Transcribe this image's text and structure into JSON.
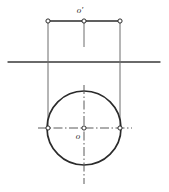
{
  "figure": {
    "type": "technical-drawing",
    "canvas": {
      "width": 169,
      "height": 192,
      "background": "#ffffff"
    },
    "colors": {
      "outline": "#2b2b2b",
      "thin_line": "#6d6d6d",
      "center_line": "#5a5a5a",
      "ground_line": "#3a3a3a",
      "node_fill": "#ffffff",
      "label": "#2b2b2b"
    },
    "labels": {
      "front_center": "o′",
      "top_center": "o"
    },
    "ground_line": {
      "name": "xy-ground-line",
      "x1": 8,
      "y1": 62,
      "x2": 160,
      "y2": 62,
      "stroke_width": 1.4
    },
    "front_view": {
      "segment": {
        "x1": 48,
        "y1": 21,
        "x2": 120,
        "y2": 21,
        "stroke_width": 1.6
      },
      "nodes": [
        {
          "name": "front-left-endpoint",
          "cx": 48,
          "cy": 21,
          "r": 2.1
        },
        {
          "name": "front-center-point",
          "cx": 84,
          "cy": 21,
          "r": 2.1
        },
        {
          "name": "front-right-endpoint",
          "cx": 120,
          "cy": 21,
          "r": 2.1
        }
      ],
      "label_pos": {
        "x": 80,
        "y": 11
      }
    },
    "projection_lines": [
      {
        "name": "projector-left",
        "x1": 48,
        "y1": 21,
        "x2": 48,
        "y2": 129,
        "stroke_width": 1.0
      },
      {
        "name": "projector-right",
        "x1": 120,
        "y1": 21,
        "x2": 120,
        "y2": 129,
        "stroke_width": 1.0
      },
      {
        "name": "projector-center-short",
        "x1": 84,
        "y1": 21,
        "x2": 84,
        "y2": 47,
        "stroke_width": 1.0
      }
    ],
    "top_view": {
      "circle": {
        "name": "top-view-circle",
        "cx": 84,
        "cy": 128,
        "r": 37,
        "stroke_width": 1.7
      },
      "center_lines": [
        {
          "name": "vertical-center-line",
          "x1": 84,
          "y1": 85,
          "x2": 84,
          "y2": 184
        },
        {
          "name": "horizontal-center-line",
          "x1": 38,
          "y1": 128,
          "x2": 132,
          "y2": 128
        }
      ],
      "nodes": [
        {
          "name": "top-center-point",
          "cx": 84,
          "cy": 128,
          "r": 2.1
        },
        {
          "name": "top-left-quadrant-point",
          "cx": 48,
          "cy": 128,
          "r": 2.1
        },
        {
          "name": "top-right-quadrant-point",
          "cx": 120,
          "cy": 128,
          "r": 2.1
        }
      ],
      "label_pos": {
        "x": 78,
        "y": 137
      }
    }
  }
}
